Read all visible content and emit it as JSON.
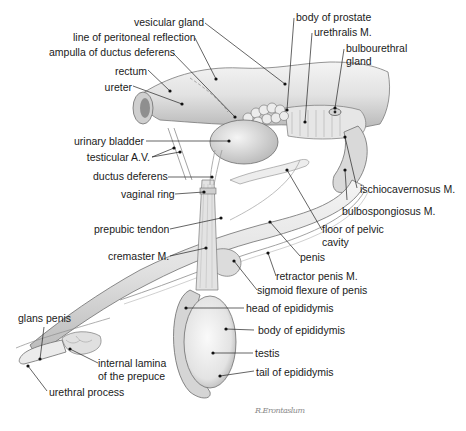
{
  "figure": {
    "colors": {
      "background": "#ffffff",
      "ink": "#1a1a1a",
      "organ_fill": "#e6e6e6",
      "organ_shade": "#bdbdbd",
      "leader": "#222222"
    },
    "signature": "R.Erontaslum"
  },
  "labels": [
    {
      "id": "vesicular-gland",
      "text": "vesicular gland",
      "x": 134,
      "y": 16,
      "align": "right",
      "w": 70
    },
    {
      "id": "line-of-peritoneal-reflection",
      "text": "line of peritoneal reflection",
      "x": 73,
      "y": 31,
      "align": "right",
      "w": 121
    },
    {
      "id": "ampulla-of-ductus-deferens",
      "text": "ampulla of ductus deferens",
      "x": 49,
      "y": 46,
      "align": "right",
      "w": 122
    },
    {
      "id": "rectum",
      "text": "rectum",
      "x": 114,
      "y": 65,
      "align": "right",
      "w": 33
    },
    {
      "id": "ureter",
      "text": "ureter",
      "x": 104,
      "y": 81,
      "align": "right",
      "w": 28
    },
    {
      "id": "body-of-prostate",
      "text": "body of prostate",
      "x": 296,
      "y": 11,
      "align": "left"
    },
    {
      "id": "urethralis-m",
      "text": "urethralis M.",
      "x": 314,
      "y": 26,
      "align": "left"
    },
    {
      "id": "bulbourethral-gland",
      "text": "bulbourethral\ngland",
      "x": 346,
      "y": 42,
      "align": "left"
    },
    {
      "id": "urinary-bladder",
      "text": "urinary bladder",
      "x": 74,
      "y": 135,
      "align": "right",
      "w": 68
    },
    {
      "id": "testicular-av",
      "text": "testicular A.V.",
      "x": 86,
      "y": 151,
      "align": "right",
      "w": 64
    },
    {
      "id": "ductus-deferens",
      "text": "ductus deferens",
      "x": 93,
      "y": 170,
      "align": "right",
      "w": 72
    },
    {
      "id": "vaginal-ring",
      "text": "vaginal ring",
      "x": 121,
      "y": 188,
      "align": "right",
      "w": 52
    },
    {
      "id": "prepubic-tendon",
      "text": "prepubic tendon",
      "x": 94,
      "y": 223,
      "align": "right",
      "w": 73
    },
    {
      "id": "cremaster-m",
      "text": "cremaster M.",
      "x": 108,
      "y": 250,
      "align": "right",
      "w": 59
    },
    {
      "id": "ischiocavernosus-m",
      "text": "ischiocavernosus M.",
      "x": 360,
      "y": 183,
      "align": "left"
    },
    {
      "id": "bulbospongiosus-m",
      "text": "bulbospongiosus M.",
      "x": 342,
      "y": 205,
      "align": "left"
    },
    {
      "id": "floor-of-pelvic-cavity",
      "text": "floor of pelvic\ncavity",
      "x": 322,
      "y": 223,
      "align": "left"
    },
    {
      "id": "penis",
      "text": "penis",
      "x": 300,
      "y": 251,
      "align": "left"
    },
    {
      "id": "retractor-penis-m",
      "text": "retractor penis M.",
      "x": 276,
      "y": 270,
      "align": "left"
    },
    {
      "id": "sigmoid-flexure-of-penis",
      "text": "sigmoid flexure of penis",
      "x": 257,
      "y": 284,
      "align": "left"
    },
    {
      "id": "head-of-epididymis",
      "text": "head of epididymis",
      "x": 246,
      "y": 302,
      "align": "left"
    },
    {
      "id": "body-of-epididymis",
      "text": "body of epididymis",
      "x": 258,
      "y": 324,
      "align": "left"
    },
    {
      "id": "testis",
      "text": "testis",
      "x": 255,
      "y": 347,
      "align": "left"
    },
    {
      "id": "tail-of-epididymis",
      "text": "tail of epididymis",
      "x": 256,
      "y": 366,
      "align": "left"
    },
    {
      "id": "glans-penis",
      "text": "glans penis",
      "x": 18,
      "y": 312,
      "align": "left"
    },
    {
      "id": "internal-lamina-of-the-prepuce",
      "text": "internal lamina\nof the prepuce",
      "x": 98,
      "y": 357,
      "align": "left"
    },
    {
      "id": "urethral-process",
      "text": "urethral process",
      "x": 49,
      "y": 386,
      "align": "left"
    }
  ],
  "leaders": [
    {
      "for": "vesicular-gland",
      "from": [
        205,
        23
      ],
      "to": [
        285,
        84
      ]
    },
    {
      "for": "line-of-peritoneal-reflection",
      "from": [
        195,
        38
      ],
      "to": [
        216,
        79
      ]
    },
    {
      "for": "ampulla-of-ductus-deferens",
      "from": [
        173,
        53
      ],
      "to": [
        235,
        117
      ]
    },
    {
      "for": "rectum",
      "from": [
        148,
        70
      ],
      "to": [
        170,
        91
      ]
    },
    {
      "for": "ureter",
      "from": [
        133,
        86
      ],
      "to": [
        182,
        104
      ]
    },
    {
      "for": "body-of-prostate",
      "from": [
        294,
        18
      ],
      "to": [
        287,
        110
      ]
    },
    {
      "for": "urethralis-m",
      "from": [
        312,
        33
      ],
      "to": [
        305,
        122
      ]
    },
    {
      "for": "bulbourethral-gland",
      "from": [
        344,
        49
      ],
      "to": [
        335,
        108
      ]
    },
    {
      "for": "urinary-bladder",
      "from": [
        146,
        141
      ],
      "to": [
        229,
        141
      ]
    },
    {
      "for": "testicular-av",
      "from": [
        152,
        157
      ],
      "to": [
        174,
        148
      ]
    },
    {
      "for": "testicular-av-2",
      "from": [
        152,
        157
      ],
      "to": [
        180,
        152
      ]
    },
    {
      "for": "ductus-deferens",
      "from": [
        168,
        177
      ],
      "to": [
        212,
        177
      ]
    },
    {
      "for": "vaginal-ring",
      "from": [
        175,
        194
      ],
      "to": [
        204,
        192
      ]
    },
    {
      "for": "prepubic-tendon",
      "from": [
        170,
        229
      ],
      "to": [
        221,
        218
      ]
    },
    {
      "for": "cremaster-m",
      "from": [
        170,
        256
      ],
      "to": [
        206,
        248
      ]
    },
    {
      "for": "ischiocavernosus-m",
      "from": [
        357,
        188
      ],
      "to": [
        345,
        137
      ]
    },
    {
      "for": "bulbospongiosus-m",
      "from": [
        347,
        200
      ],
      "to": [
        345,
        170
      ]
    },
    {
      "for": "floor-of-pelvic-cavity",
      "from": [
        322,
        230
      ],
      "to": [
        287,
        170
      ]
    },
    {
      "for": "penis",
      "from": [
        300,
        256
      ],
      "to": [
        270,
        222
      ]
    },
    {
      "for": "retractor-penis-m",
      "from": [
        276,
        276
      ],
      "to": [
        268,
        253
      ]
    },
    {
      "for": "sigmoid-flexure-of-penis",
      "from": [
        257,
        290
      ],
      "to": [
        234,
        261
      ]
    },
    {
      "for": "head-of-epididymis",
      "from": [
        244,
        308
      ],
      "to": [
        186,
        308
      ]
    },
    {
      "for": "body-of-epididymis",
      "from": [
        254,
        330
      ],
      "to": [
        226,
        329
      ]
    },
    {
      "for": "testis",
      "from": [
        253,
        353
      ],
      "to": [
        213,
        353
      ]
    },
    {
      "for": "tail-of-epididymis",
      "from": [
        254,
        371
      ],
      "to": [
        220,
        376
      ]
    },
    {
      "for": "glans-penis",
      "from": [
        44,
        327
      ],
      "to": [
        40,
        359
      ]
    },
    {
      "for": "internal-lamina-of-the-prepuce",
      "from": [
        98,
        363
      ],
      "to": [
        70,
        349
      ]
    },
    {
      "for": "urethral-process",
      "from": [
        47,
        391
      ],
      "to": [
        28,
        366
      ]
    }
  ]
}
